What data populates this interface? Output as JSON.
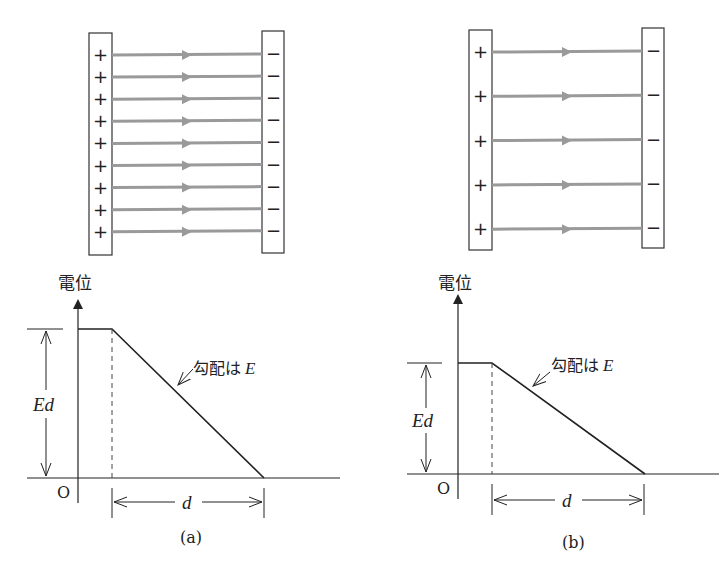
{
  "panels": [
    {
      "id": "a",
      "caption": "(a)",
      "field_lines": 9,
      "plus_sign": "+",
      "minus_sign": "−",
      "axis_label": "電位",
      "origin_label": "O",
      "height_label": "Ed",
      "distance_label": "d",
      "slope_label": "勾配は",
      "slope_symbol": "E"
    },
    {
      "id": "b",
      "caption": "(b)",
      "field_lines": 5,
      "plus_sign": "+",
      "minus_sign": "−",
      "axis_label": "電位",
      "origin_label": "O",
      "height_label": "Ed",
      "distance_label": "d",
      "slope_label": "勾配は",
      "slope_symbol": "E"
    }
  ],
  "colors": {
    "line": "#222222",
    "field": "#9a9a9a",
    "plate": "#333333"
  }
}
